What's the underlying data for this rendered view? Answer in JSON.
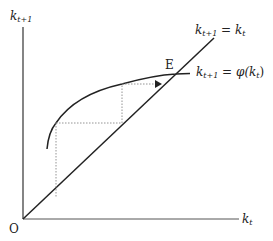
{
  "diagram": {
    "type": "phase-diagram",
    "axes": {
      "y_label": {
        "base": "k",
        "sub": "t+1"
      },
      "x_label": {
        "base": "k",
        "sub": "t"
      },
      "origin_label": "O"
    },
    "curves": {
      "diagonal": {
        "label_lhs_base": "k",
        "label_lhs_sub": "t+1",
        "label_eq": " = ",
        "label_rhs_base": "k",
        "label_rhs_sub": "t"
      },
      "phi": {
        "label_lhs_base": "k",
        "label_lhs_sub": "t+1",
        "label_eq": " = ",
        "label_fn": "φ(",
        "label_rhs_base": "k",
        "label_rhs_sub": "t",
        "label_close": ")"
      }
    },
    "equilibrium_label": "E",
    "colors": {
      "line": "#222222",
      "dotted": "#888888"
    }
  }
}
